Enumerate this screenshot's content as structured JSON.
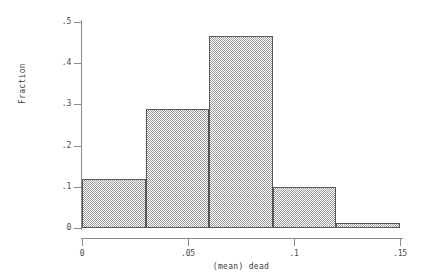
{
  "figure": {
    "background_color": "#ffffff",
    "axis_color": "#8a8a8a",
    "bar_edge_color": "#555555",
    "bar_fill_color": "#9a9a9a",
    "text_color": "#3d3d3d"
  },
  "chart_data": {
    "type": "bar",
    "title": "",
    "subtitle": "",
    "xlabel": "(mean) dead",
    "ylabel": "Fraction",
    "xlim": [
      0,
      0.15
    ],
    "ylim": [
      0,
      0.5
    ],
    "grid": false,
    "legend": null,
    "bin_width": 0.03,
    "bin_edges": [
      0,
      0.03,
      0.06,
      0.09,
      0.12,
      0.15
    ],
    "categories": [
      "0–.03",
      ".03–.06",
      ".06–.09",
      ".09–.12",
      ".12–.15"
    ],
    "values": [
      0.12,
      0.29,
      0.465,
      0.1,
      0.012
    ],
    "xticks": [
      0,
      0.05,
      0.1,
      0.15
    ],
    "xtick_labels": [
      "0",
      ".05",
      ".1",
      ".15"
    ],
    "yticks": [
      0,
      0.1,
      0.2,
      0.3,
      0.4,
      0.5
    ],
    "ytick_labels": [
      "0",
      ".1",
      ".2",
      ".3",
      ".4",
      ".5"
    ]
  }
}
